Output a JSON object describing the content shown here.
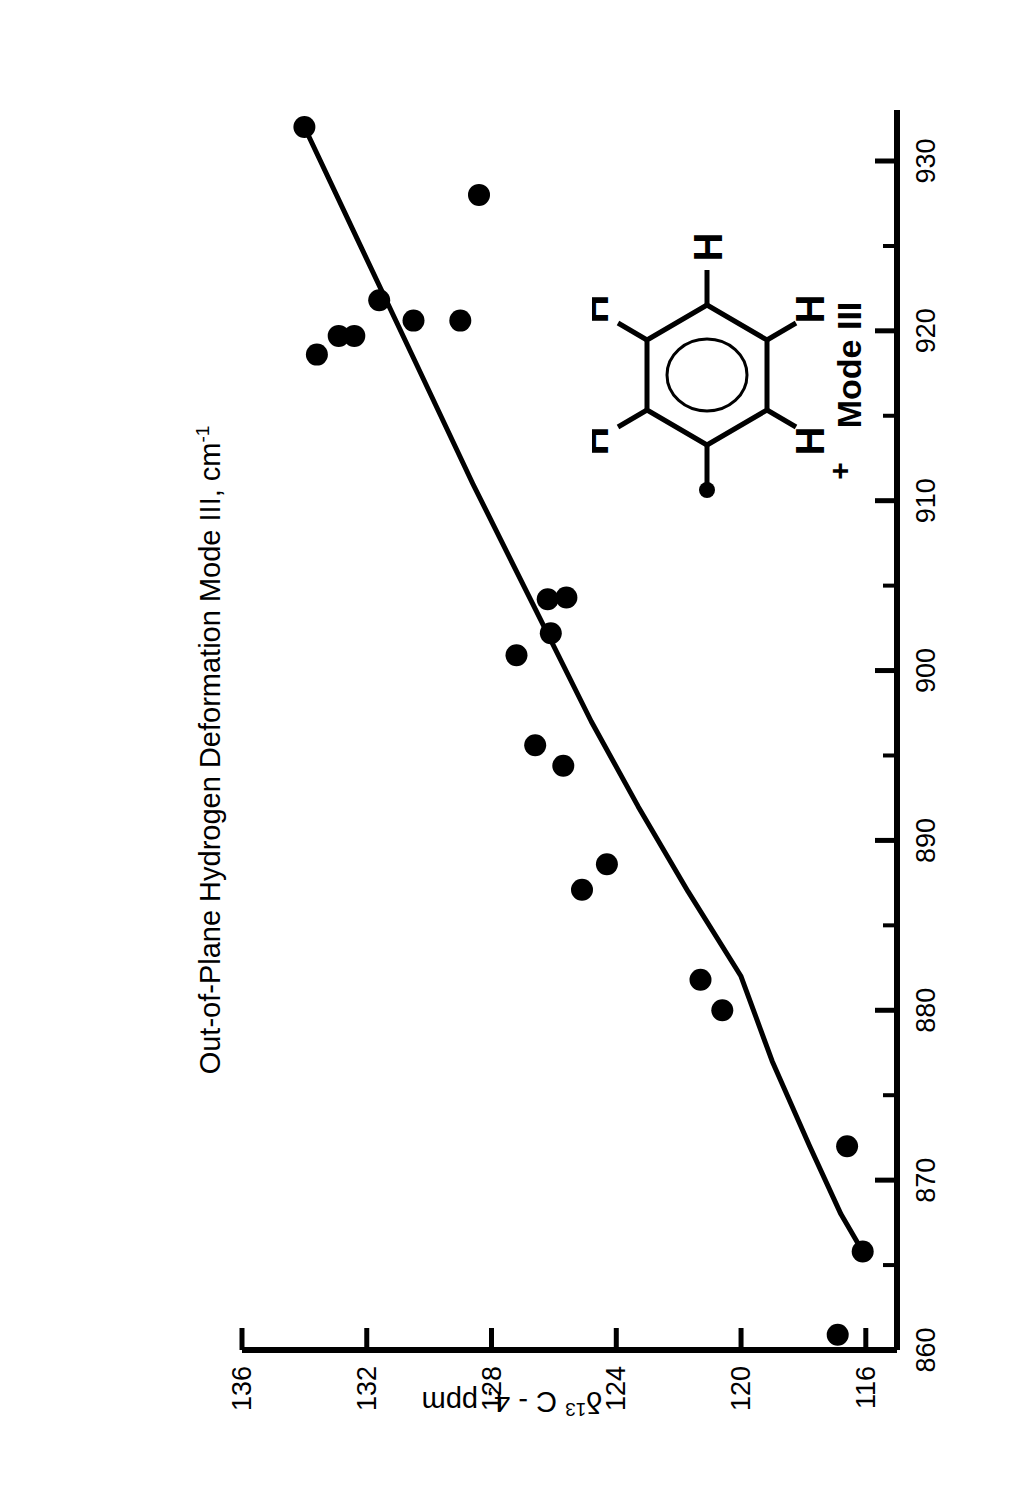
{
  "chart_data": {
    "type": "scatter",
    "title": "",
    "xlabel": "Out-of-Plane Hydrogen Deformation Mode III, cm-1",
    "xlabel_main": "Out-of-Plane Hydrogen Deformation Mode III, cm",
    "xlabel_sup": "-1",
    "ylabel_delta": "δ",
    "ylabel_sup": "13",
    "ylabel_rest": " C - 4, ppm",
    "ylabel": "δ13 C - 4, ppm",
    "xlim": [
      860,
      933
    ],
    "ylim": [
      115,
      136
    ],
    "xticks": [
      860,
      870,
      880,
      890,
      900,
      910,
      920,
      930
    ],
    "xtick_labels": [
      "860",
      "870",
      "880",
      "890",
      "900",
      "910",
      "920",
      "930"
    ],
    "xminor_step": 5,
    "yticks": [
      136,
      132,
      128,
      124,
      120,
      116
    ],
    "ytick_labels": [
      "136",
      "132",
      "128",
      "124",
      "120",
      "116"
    ],
    "y_inverted": true,
    "grid": false,
    "legend": null,
    "marker": "filled-circle",
    "marker_color": "#000000",
    "line_color": "#000000",
    "points": [
      {
        "x": 932.0,
        "y": 134.0
      },
      {
        "x": 928.0,
        "y": 128.4
      },
      {
        "x": 921.8,
        "y": 131.6
      },
      {
        "x": 920.6,
        "y": 130.5
      },
      {
        "x": 920.6,
        "y": 129.0
      },
      {
        "x": 919.7,
        "y": 132.9
      },
      {
        "x": 919.7,
        "y": 132.4
      },
      {
        "x": 918.6,
        "y": 133.6
      },
      {
        "x": 904.3,
        "y": 125.6
      },
      {
        "x": 904.2,
        "y": 126.2
      },
      {
        "x": 902.2,
        "y": 126.1
      },
      {
        "x": 900.9,
        "y": 127.2
      },
      {
        "x": 895.6,
        "y": 126.6
      },
      {
        "x": 894.4,
        "y": 125.7
      },
      {
        "x": 888.6,
        "y": 124.3
      },
      {
        "x": 887.1,
        "y": 125.1
      },
      {
        "x": 881.8,
        "y": 121.3
      },
      {
        "x": 880.0,
        "y": 120.6
      },
      {
        "x": 872.0,
        "y": 116.6
      },
      {
        "x": 865.8,
        "y": 116.1
      },
      {
        "x": 860.9,
        "y": 116.9
      }
    ],
    "fit_curve": [
      {
        "x": 932.0,
        "y": 134.0
      },
      {
        "x": 925.0,
        "y": 132.2
      },
      {
        "x": 918.0,
        "y": 130.4
      },
      {
        "x": 911.0,
        "y": 128.6
      },
      {
        "x": 904.0,
        "y": 126.7
      },
      {
        "x": 897.0,
        "y": 124.8
      },
      {
        "x": 892.0,
        "y": 123.3
      },
      {
        "x": 887.0,
        "y": 121.7
      },
      {
        "x": 882.0,
        "y": 120.0
      },
      {
        "x": 877.0,
        "y": 119.0
      },
      {
        "x": 872.0,
        "y": 117.8
      },
      {
        "x": 868.0,
        "y": 116.8
      },
      {
        "x": 865.8,
        "y": 116.1
      }
    ]
  },
  "inset": {
    "mode_label": "Mode III",
    "hydrogens": [
      {
        "label": "H",
        "charge": "+"
      },
      {
        "label": "H",
        "charge": ""
      },
      {
        "label": "H",
        "charge": ""
      },
      {
        "label": "H",
        "charge": ""
      },
      {
        "label": "H",
        "charge": "+"
      }
    ],
    "h_top_left": "H",
    "h_top_left_charge": "+",
    "h_top_right": "H",
    "h_right": "H",
    "h_bottom_right": "H",
    "h_bottom_left": "H",
    "h_bottom_left_charge": "+"
  }
}
